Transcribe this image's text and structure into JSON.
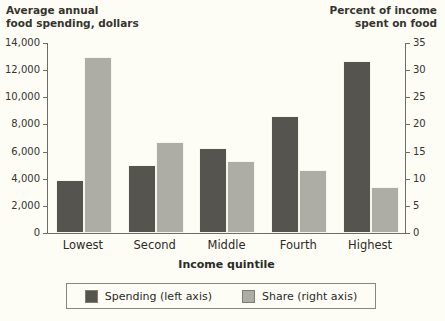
{
  "chart_data": {
    "type": "bar",
    "title": "",
    "xlabel": "Income quintile",
    "categories": [
      "Lowest",
      "Second",
      "Middle",
      "Fourth",
      "Highest"
    ],
    "series": [
      {
        "name": "Spending (left axis)",
        "axis": "left",
        "color": "#55544f",
        "values": [
          3900,
          5000,
          6250,
          8600,
          12700
        ]
      },
      {
        "name": "Share (right axis)",
        "axis": "right",
        "color": "#adaca5",
        "values": [
          32.4,
          16.8,
          13.2,
          11.6,
          8.5
        ]
      }
    ],
    "left_axis": {
      "label_line1": "Average annual",
      "label_line2": "food spending, dollars",
      "ylim": [
        0,
        14000
      ],
      "ticks": [
        0,
        2000,
        4000,
        6000,
        8000,
        10000,
        12000,
        14000
      ],
      "tick_labels": [
        "0",
        "2,000",
        "4,000",
        "6,000",
        "8,000",
        "10,000",
        "12,000",
        "14,000"
      ]
    },
    "right_axis": {
      "label_line1": "Percent of income",
      "label_line2": "spent on food",
      "ylim": [
        0,
        35
      ],
      "ticks": [
        0,
        5,
        10,
        15,
        20,
        25,
        30,
        35
      ],
      "tick_labels": [
        "0",
        "5",
        "10",
        "15",
        "20",
        "25",
        "30",
        "35"
      ]
    },
    "grid": false,
    "legend_position": "bottom-center"
  },
  "legend": {
    "items": [
      {
        "label": "Spending (left axis)",
        "color": "#55544f"
      },
      {
        "label": "Share (right axis)",
        "color": "#adaca5"
      }
    ]
  },
  "colors": {
    "background": "#fdfdf6",
    "axis": "#6d6c66",
    "text": "#2b2a26",
    "spending": "#55544f",
    "share": "#adaca5"
  }
}
